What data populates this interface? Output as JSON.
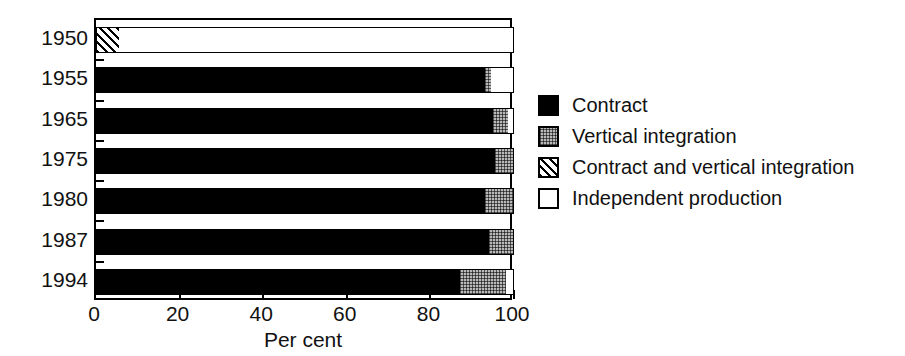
{
  "chart_data": {
    "type": "bar",
    "orientation": "horizontal",
    "stacked": true,
    "title": "",
    "xlabel": "Per cent",
    "ylabel": "",
    "xlim": [
      0,
      100
    ],
    "xticks": [
      0,
      20,
      40,
      60,
      80,
      100
    ],
    "xticklabels": [
      "0",
      "20",
      "40",
      "60",
      "80",
      "100"
    ],
    "categories": [
      "1950",
      "1955",
      "1965",
      "1975",
      "1980",
      "1987",
      "1994"
    ],
    "grid": false,
    "legend_position": "right",
    "series": [
      {
        "name": "Contract",
        "key": "contract",
        "fill": "solid-black",
        "color": "#000000",
        "values": [
          0,
          93,
          95,
          95.5,
          93,
          94,
          87
        ]
      },
      {
        "name": "Vertical integration",
        "key": "vertical",
        "fill": "gray-stipple",
        "color": "#b9b9b9",
        "values": [
          0,
          1.5,
          3.5,
          4.5,
          7,
          6,
          11
        ]
      },
      {
        "name": "Contract and vertical integration",
        "key": "both",
        "fill": "diagonal-hatch",
        "color": "#ffffff",
        "values": [
          5.5,
          0,
          0,
          0,
          0,
          0,
          0
        ]
      },
      {
        "name": "Independent production",
        "key": "independent",
        "fill": "white",
        "color": "#ffffff",
        "values": [
          94.5,
          5.5,
          1.5,
          0,
          0,
          0,
          2
        ]
      }
    ]
  },
  "legend": {
    "items": [
      {
        "label": "Contract",
        "swatch": "solid-black-swatch"
      },
      {
        "label": "Vertical integration",
        "swatch": "gray-stipple-swatch"
      },
      {
        "label": "Contract and vertical integration",
        "swatch": "diagonal-hatch-swatch"
      },
      {
        "label": "Independent production",
        "swatch": "white-swatch"
      }
    ]
  }
}
